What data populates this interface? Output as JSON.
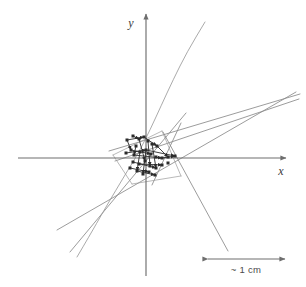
{
  "figure": {
    "background_color": "#ffffff",
    "width": 306,
    "height": 287
  },
  "axes": {
    "x_axis": {
      "label": "x",
      "label_x": 281,
      "label_y": 175,
      "start_x": 18,
      "end_x": 286,
      "y": 158,
      "color": "#6e6e6e",
      "arrow": "right"
    },
    "y_axis": {
      "label": "y",
      "label_x": 131,
      "label_y": 27,
      "top_y": 14,
      "bottom_y": 276,
      "x": 146,
      "color": "#6e6e6e",
      "arrow": "up"
    },
    "origin": {
      "x": 146,
      "y": 158
    }
  },
  "scale_bar": {
    "label": "~ 1 cm",
    "label_x": 246,
    "label_y": 273,
    "left_x": 208,
    "right_x": 285,
    "y": 259,
    "color": "#6e6e6e"
  },
  "colors": {
    "line_gray": "#8a8a8a",
    "line_gray_light": "#9b9b9b",
    "axis_gray": "#6e6e6e",
    "point_dark": "#2b2b2b",
    "text_gray": "#3a3a3a",
    "background": "#ffffff"
  },
  "chart_data": {
    "type": "scatter",
    "xlabel": "x",
    "ylabel": "y",
    "grid": false,
    "legend": null,
    "annotations": [
      {
        "text": "~ 1 cm",
        "x": 246,
        "y": 273,
        "role": "scale-bar-label"
      },
      {
        "text": "y",
        "x": 131,
        "y": 27,
        "role": "axis-label"
      },
      {
        "text": "x",
        "x": 281,
        "y": 175,
        "role": "axis-label"
      }
    ],
    "long_lines": [
      {
        "name": "line-1",
        "x1": 109,
        "y1": 151,
        "x2": 300,
        "y2": 94
      },
      {
        "name": "line-2",
        "x1": 115,
        "y1": 161,
        "x2": 299,
        "y2": 99
      },
      {
        "name": "line-3",
        "x1": 57,
        "y1": 230,
        "x2": 296,
        "y2": 92
      },
      {
        "name": "line-4",
        "x1": 70,
        "y1": 252,
        "x2": 186,
        "y2": 113
      },
      {
        "name": "line-5",
        "x1": 163,
        "y1": 132,
        "x2": 228,
        "y2": 251
      },
      {
        "name": "line-6",
        "x1": 152,
        "y1": 185,
        "x2": 181,
        "y2": 123
      }
    ],
    "curves": [
      {
        "name": "curve-1",
        "points": [
          [
            77,
            257
          ],
          [
            90,
            235
          ],
          [
            103,
            212
          ],
          [
            116,
            190
          ],
          [
            128,
            170
          ],
          [
            139,
            152
          ],
          [
            150,
            130
          ],
          [
            161,
            106
          ],
          [
            173,
            80
          ],
          [
            187,
            52
          ],
          [
            205,
            22
          ]
        ]
      }
    ],
    "cluster_points": [
      {
        "x": 127,
        "y": 140
      },
      {
        "x": 133,
        "y": 136
      },
      {
        "x": 139,
        "y": 139
      },
      {
        "x": 144,
        "y": 137
      },
      {
        "x": 148,
        "y": 141
      },
      {
        "x": 152,
        "y": 144
      },
      {
        "x": 157,
        "y": 146
      },
      {
        "x": 136,
        "y": 146
      },
      {
        "x": 131,
        "y": 150
      },
      {
        "x": 126,
        "y": 153
      },
      {
        "x": 134,
        "y": 155
      },
      {
        "x": 140,
        "y": 152
      },
      {
        "x": 146,
        "y": 150
      },
      {
        "x": 151,
        "y": 154
      },
      {
        "x": 156,
        "y": 157
      },
      {
        "x": 162,
        "y": 158
      },
      {
        "x": 168,
        "y": 157
      },
      {
        "x": 175,
        "y": 156
      },
      {
        "x": 133,
        "y": 162
      },
      {
        "x": 139,
        "y": 164
      },
      {
        "x": 145,
        "y": 161
      },
      {
        "x": 150,
        "y": 166
      },
      {
        "x": 156,
        "y": 168
      },
      {
        "x": 162,
        "y": 165
      },
      {
        "x": 137,
        "y": 171
      },
      {
        "x": 143,
        "y": 174
      },
      {
        "x": 149,
        "y": 172
      },
      {
        "x": 155,
        "y": 175
      },
      {
        "x": 130,
        "y": 168
      },
      {
        "x": 168,
        "y": 163
      }
    ],
    "cluster_segments": [
      {
        "x1": 127,
        "y1": 140,
        "x2": 144,
        "y2": 137
      },
      {
        "x1": 144,
        "y1": 137,
        "x2": 157,
        "y2": 146
      },
      {
        "x1": 133,
        "y1": 136,
        "x2": 139,
        "y2": 139
      },
      {
        "x1": 126,
        "y1": 153,
        "x2": 146,
        "y2": 150
      },
      {
        "x1": 146,
        "y1": 150,
        "x2": 175,
        "y2": 156
      },
      {
        "x1": 131,
        "y1": 150,
        "x2": 151,
        "y2": 154
      },
      {
        "x1": 134,
        "y1": 155,
        "x2": 162,
        "y2": 158
      },
      {
        "x1": 133,
        "y1": 162,
        "x2": 156,
        "y2": 168
      },
      {
        "x1": 139,
        "y1": 164,
        "x2": 162,
        "y2": 165
      },
      {
        "x1": 137,
        "y1": 171,
        "x2": 155,
        "y2": 175
      },
      {
        "x1": 146,
        "y1": 150,
        "x2": 143,
        "y2": 174
      },
      {
        "x1": 140,
        "y1": 152,
        "x2": 137,
        "y2": 171
      },
      {
        "x1": 148,
        "y1": 141,
        "x2": 150,
        "y2": 166
      },
      {
        "x1": 152,
        "y1": 144,
        "x2": 156,
        "y2": 168
      },
      {
        "x1": 136,
        "y1": 146,
        "x2": 134,
        "y2": 155
      },
      {
        "x1": 127,
        "y1": 140,
        "x2": 131,
        "y2": 150
      },
      {
        "x1": 157,
        "y1": 146,
        "x2": 168,
        "y2": 157
      },
      {
        "x1": 162,
        "y1": 158,
        "x2": 175,
        "y2": 156
      },
      {
        "x1": 130,
        "y1": 168,
        "x2": 149,
        "y2": 172
      },
      {
        "x1": 139,
        "y1": 139,
        "x2": 145,
        "y2": 161
      }
    ],
    "boundary_quad": [
      {
        "x1": 113,
        "y1": 155,
        "x2": 162,
        "y2": 131
      },
      {
        "x1": 162,
        "y1": 131,
        "x2": 181,
        "y2": 176
      },
      {
        "x1": 181,
        "y1": 176,
        "x2": 132,
        "y2": 184
      },
      {
        "x1": 132,
        "y1": 184,
        "x2": 113,
        "y2": 155
      }
    ]
  }
}
